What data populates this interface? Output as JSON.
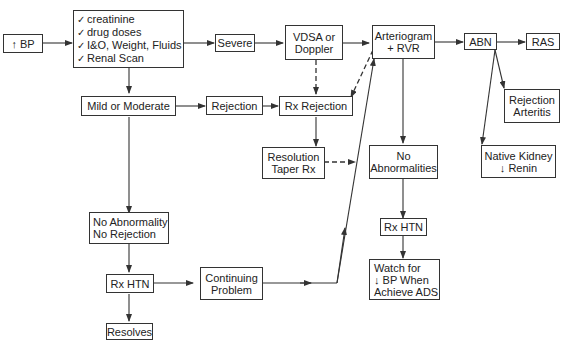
{
  "diagram": {
    "type": "flowchart",
    "nodes": {
      "bp": {
        "lines": [
          "↑ BP"
        ]
      },
      "checks": {
        "lines": [
          "creatinine",
          "drug doses",
          "I&O, Weight, Fluids",
          "Renal Scan"
        ],
        "bullet": "✓"
      },
      "severe": {
        "lines": [
          "Severe"
        ]
      },
      "vdsa": {
        "lines": [
          "VDSA or",
          "Doppler"
        ]
      },
      "arteriogram": {
        "lines": [
          "Arteriogram",
          "+ RVR"
        ]
      },
      "abn": {
        "lines": [
          "ABN"
        ]
      },
      "ras": {
        "lines": [
          "RAS"
        ]
      },
      "mild": {
        "lines": [
          "Mild or Moderate"
        ]
      },
      "rejection": {
        "lines": [
          "Rejection"
        ]
      },
      "rx_rejection": {
        "lines": [
          "Rx Rejection"
        ]
      },
      "rejection_arteritis": {
        "lines": [
          "Rejection",
          "Arteritis"
        ]
      },
      "resolution": {
        "lines": [
          "Resolution",
          "Taper Rx"
        ]
      },
      "no_abnormalities": {
        "lines": [
          "No",
          "Abnormalities"
        ]
      },
      "native_kidney": {
        "lines": [
          "Native Kidney",
          "↓ Renin"
        ]
      },
      "no_abnormality_no_rejection": {
        "lines": [
          "No Abnormality",
          "No Rejection"
        ]
      },
      "rx_htn_left": {
        "lines": [
          "Rx HTN"
        ]
      },
      "continuing_problem": {
        "lines": [
          "Continuing",
          "Problem"
        ]
      },
      "rx_htn_right": {
        "lines": [
          "Rx HTN"
        ]
      },
      "watch_for": {
        "lines": [
          "Watch for",
          "↓ BP When",
          "Achieve ADS"
        ]
      },
      "resolves": {
        "lines": [
          "Resolves"
        ]
      }
    },
    "edges": [
      {
        "from": "bp",
        "to": "checks",
        "style": "solid"
      },
      {
        "from": "checks",
        "to": "severe",
        "style": "solid"
      },
      {
        "from": "severe",
        "to": "vdsa",
        "style": "solid"
      },
      {
        "from": "vdsa",
        "to": "arteriogram",
        "style": "solid"
      },
      {
        "from": "arteriogram",
        "to": "abn",
        "style": "solid"
      },
      {
        "from": "abn",
        "to": "ras",
        "style": "solid"
      },
      {
        "from": "abn",
        "to": "rejection_arteritis",
        "style": "solid"
      },
      {
        "from": "abn",
        "to": "native_kidney",
        "style": "solid"
      },
      {
        "from": "checks",
        "to": "mild",
        "style": "solid"
      },
      {
        "from": "mild",
        "to": "rejection",
        "style": "solid"
      },
      {
        "from": "rejection",
        "to": "rx_rejection",
        "style": "solid"
      },
      {
        "from": "vdsa",
        "to": "rx_rejection",
        "style": "dashed"
      },
      {
        "from": "arteriogram",
        "to": "rx_rejection",
        "style": "dashed"
      },
      {
        "from": "rx_rejection",
        "to": "resolution",
        "style": "solid"
      },
      {
        "from": "resolution",
        "to": "arteriogram_line",
        "style": "dashed"
      },
      {
        "from": "arteriogram",
        "to": "no_abnormalities",
        "style": "solid"
      },
      {
        "from": "no_abnormalities",
        "to": "rx_htn_right",
        "style": "solid"
      },
      {
        "from": "rx_htn_right",
        "to": "watch_for",
        "style": "solid"
      },
      {
        "from": "mild",
        "to": "no_abnormality_no_rejection",
        "style": "solid"
      },
      {
        "from": "no_abnormality_no_rejection",
        "to": "rx_htn_left",
        "style": "solid"
      },
      {
        "from": "rx_htn_left",
        "to": "continuing_problem",
        "style": "solid"
      },
      {
        "from": "continuing_problem",
        "to": "arteriogram",
        "style": "solid"
      },
      {
        "from": "rx_htn_left",
        "to": "resolves",
        "style": "solid"
      }
    ]
  }
}
